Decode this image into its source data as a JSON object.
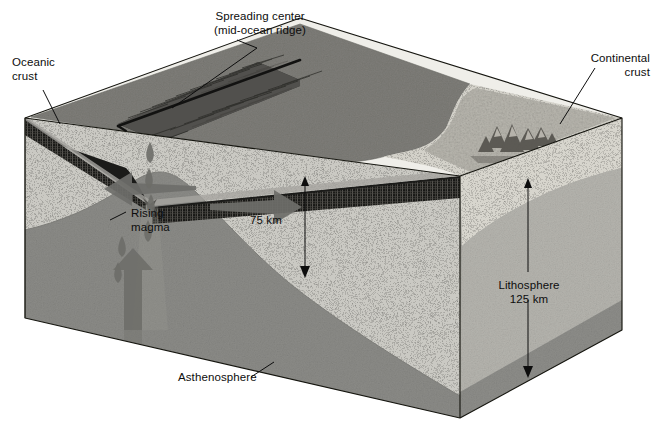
{
  "figure": {
    "kind": "geology-block-diagram",
    "background_color": "#ffffff"
  },
  "labels": {
    "oceanic_crust": "Oceanic\ncrust",
    "spreading_center": "Spreading center\n(mid-ocean ridge)",
    "continental_crust": "Continental\ncrust",
    "rising_magma": "Rising\nmagma",
    "depth_75": "75 km",
    "lithosphere": "Lithosphere\n125 km",
    "asthenosphere": "Asthenosphere"
  },
  "measurements": {
    "lithosphere_thickness_oceanic": "75 km",
    "lithosphere_thickness_continental": "125 km"
  },
  "layers": [
    {
      "name": "seawater",
      "color": "#f0efeb"
    },
    {
      "name": "ocean-floor-surface",
      "color": "#8e8d88"
    },
    {
      "name": "oceanic-crust",
      "color": "#1d1d1b"
    },
    {
      "name": "lithosphere",
      "color": "#c9c8c2"
    },
    {
      "name": "asthenosphere",
      "color": "#8a8a86"
    },
    {
      "name": "continental-surface",
      "color": "#b4b2ab"
    },
    {
      "name": "continental-crust",
      "color": "#d9d8d2"
    },
    {
      "name": "side-face-right",
      "color": "#a8a7a1"
    }
  ],
  "colors": {
    "ink": "#0d0d0d",
    "outline": "#111111",
    "arrow_fill": "#6e6e6a",
    "ridge_line": "#131313"
  },
  "annotations": [
    {
      "name": "oceanic-crust-leader",
      "type": "leader-line"
    },
    {
      "name": "spreading-center-leader",
      "type": "leader-line"
    },
    {
      "name": "continental-crust-leader",
      "type": "leader-line"
    },
    {
      "name": "rising-magma-leader",
      "type": "leader-line"
    },
    {
      "name": "asthenosphere-leader",
      "type": "leader-line"
    },
    {
      "name": "depth-75-arrow",
      "type": "double-arrow-vertical"
    },
    {
      "name": "lithosphere-depth-arrow",
      "type": "double-arrow-vertical"
    }
  ],
  "flow_arrows": [
    {
      "name": "spreading-arrow-left",
      "direction": "left"
    },
    {
      "name": "spreading-arrow-right",
      "direction": "right"
    },
    {
      "name": "magma-upwelling-arrow",
      "direction": "up"
    },
    {
      "name": "magma-droplets",
      "direction": "up",
      "count": 6
    }
  ]
}
